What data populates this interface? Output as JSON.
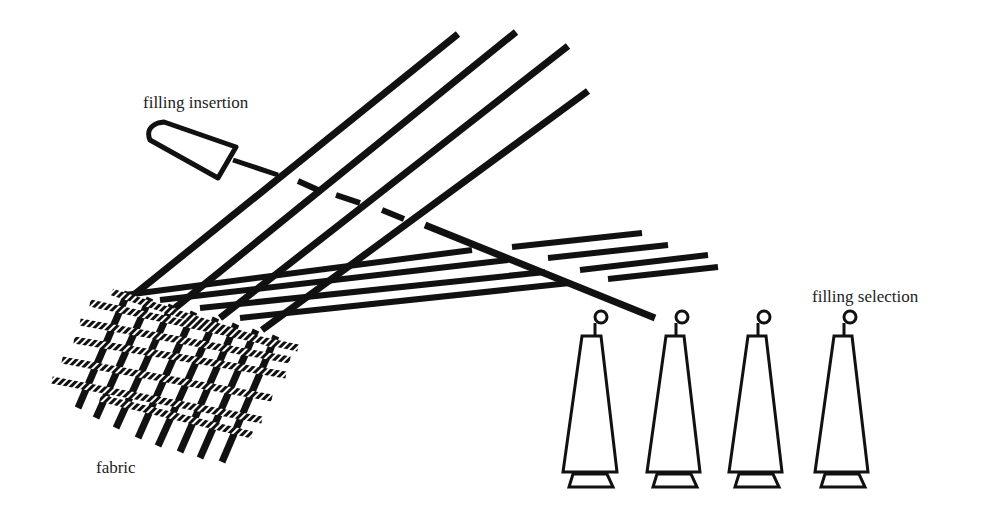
{
  "diagram": {
    "type": "weaving-loom-schematic",
    "labels": {
      "filling_insertion": "filling insertion",
      "filling_selection": "filling selection",
      "fabric": "fabric"
    },
    "components": {
      "shuttle": "filling insertion shuttle",
      "warp_yarns_count": 4,
      "lower_warp_sheds_count": 8,
      "filling_packages_count": 4,
      "selected_package_index": 2
    },
    "colors": {
      "ink": "#111111",
      "background": "#ffffff",
      "filling_stripe": "#ffffff"
    }
  }
}
